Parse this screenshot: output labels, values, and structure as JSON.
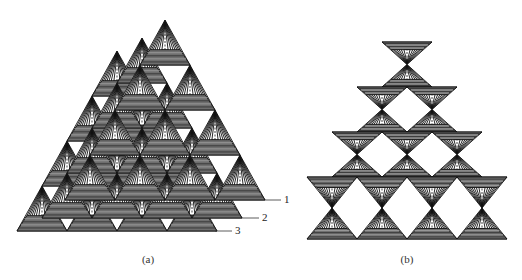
{
  "figure": {
    "panels": [
      {
        "id": "a",
        "caption": "(a)",
        "caption_pos": {
          "x": 148,
          "y": 253
        },
        "description": "Three stacked offset pyramid layers of upright striped triangles",
        "triangle": {
          "width": 50,
          "height": 45
        },
        "layers": [
          {
            "label": "3",
            "apex": {
              "x": 117,
              "y": 51
            },
            "rows": 4,
            "leader": {
              "x1": 215,
              "y1": 231,
              "x2": 232,
              "y2": 231
            },
            "label_pos": {
              "x": 235,
              "y": 224
            }
          },
          {
            "label": "2",
            "apex": {
              "x": 142,
              "y": 38
            },
            "rows": 4,
            "leader": {
              "x1": 242,
              "y1": 218,
              "x2": 259,
              "y2": 218
            },
            "label_pos": {
              "x": 262,
              "y": 211
            }
          },
          {
            "label": "1",
            "apex": {
              "x": 165,
              "y": 20
            },
            "rows": 4,
            "leader": {
              "x1": 265,
              "y1": 200,
              "x2": 281,
              "y2": 200
            },
            "label_pos": {
              "x": 284,
              "y": 193
            }
          }
        ]
      },
      {
        "id": "b",
        "caption": "(b)",
        "caption_pos": {
          "x": 407,
          "y": 253
        },
        "description": "Pyramid of hourglass units (inverted + upright triangle pairs)",
        "unit": {
          "width": 50,
          "height": 45
        },
        "top_center": {
          "x": 407,
          "y": 42
        },
        "rows": 4,
        "last_row_lower_height": 62
      }
    ]
  },
  "colors": {
    "stroke": "#111111",
    "stripe_light": "#ffffff",
    "band_fill": "#6e6e6e",
    "band_dark": "#3a3a3a",
    "text": "#222222"
  }
}
